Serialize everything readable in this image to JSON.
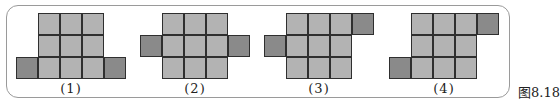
{
  "figure": {
    "caption": "图8.18",
    "cell_size": 22,
    "colors": {
      "light": "#b3b3b3",
      "dark": "#8a8a8a",
      "border": "#2f2f2f",
      "frame": "#9a9a9a"
    },
    "panels": [
      {
        "label": "(1)",
        "origin_x": 38,
        "label_x": 71,
        "cells": [
          {
            "c": 0,
            "r": 0,
            "t": "light"
          },
          {
            "c": 1,
            "r": 0,
            "t": "light"
          },
          {
            "c": 2,
            "r": 0,
            "t": "light"
          },
          {
            "c": 0,
            "r": 1,
            "t": "light"
          },
          {
            "c": 1,
            "r": 1,
            "t": "light"
          },
          {
            "c": 2,
            "r": 1,
            "t": "light"
          },
          {
            "c": 0,
            "r": 2,
            "t": "light"
          },
          {
            "c": 1,
            "r": 2,
            "t": "light"
          },
          {
            "c": 2,
            "r": 2,
            "t": "light"
          },
          {
            "c": -1,
            "r": 2,
            "t": "dark"
          },
          {
            "c": 3,
            "r": 2,
            "t": "dark"
          }
        ]
      },
      {
        "label": "(2)",
        "origin_x": 162,
        "label_x": 195,
        "cells": [
          {
            "c": 0,
            "r": 0,
            "t": "light"
          },
          {
            "c": 1,
            "r": 0,
            "t": "light"
          },
          {
            "c": 2,
            "r": 0,
            "t": "light"
          },
          {
            "c": 0,
            "r": 1,
            "t": "light"
          },
          {
            "c": 1,
            "r": 1,
            "t": "light"
          },
          {
            "c": 2,
            "r": 1,
            "t": "light"
          },
          {
            "c": 0,
            "r": 2,
            "t": "light"
          },
          {
            "c": 1,
            "r": 2,
            "t": "light"
          },
          {
            "c": 2,
            "r": 2,
            "t": "light"
          },
          {
            "c": -1,
            "r": 1,
            "t": "dark"
          },
          {
            "c": 3,
            "r": 1,
            "t": "dark"
          }
        ]
      },
      {
        "label": "(3)",
        "origin_x": 286,
        "label_x": 319,
        "cells": [
          {
            "c": 0,
            "r": 0,
            "t": "light"
          },
          {
            "c": 1,
            "r": 0,
            "t": "light"
          },
          {
            "c": 2,
            "r": 0,
            "t": "light"
          },
          {
            "c": 0,
            "r": 1,
            "t": "light"
          },
          {
            "c": 1,
            "r": 1,
            "t": "light"
          },
          {
            "c": 2,
            "r": 1,
            "t": "light"
          },
          {
            "c": 0,
            "r": 2,
            "t": "light"
          },
          {
            "c": 1,
            "r": 2,
            "t": "light"
          },
          {
            "c": 2,
            "r": 2,
            "t": "light"
          },
          {
            "c": 3,
            "r": 0,
            "t": "dark"
          },
          {
            "c": -1,
            "r": 1,
            "t": "dark"
          }
        ]
      },
      {
        "label": "(4)",
        "origin_x": 411,
        "label_x": 444,
        "cells": [
          {
            "c": 0,
            "r": 0,
            "t": "light"
          },
          {
            "c": 1,
            "r": 0,
            "t": "light"
          },
          {
            "c": 2,
            "r": 0,
            "t": "light"
          },
          {
            "c": 0,
            "r": 1,
            "t": "light"
          },
          {
            "c": 1,
            "r": 1,
            "t": "light"
          },
          {
            "c": 2,
            "r": 1,
            "t": "light"
          },
          {
            "c": 0,
            "r": 2,
            "t": "light"
          },
          {
            "c": 1,
            "r": 2,
            "t": "light"
          },
          {
            "c": 2,
            "r": 2,
            "t": "light"
          },
          {
            "c": 3,
            "r": 0,
            "t": "dark"
          },
          {
            "c": -1,
            "r": 2,
            "t": "dark"
          }
        ]
      }
    ],
    "origin_y": 13
  }
}
